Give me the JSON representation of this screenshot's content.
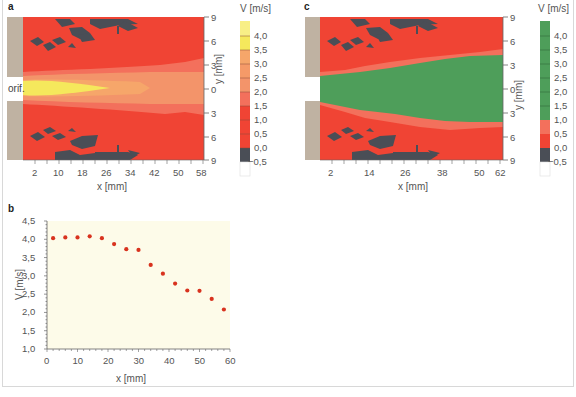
{
  "figure": {
    "panels": [
      "a",
      "b",
      "c"
    ],
    "colorbar_title": "V [m/s]",
    "orifice_label": "orif.",
    "colors": {
      "tan": "#bfb2a2",
      "red": "#f04434",
      "salmon": "#f3705c",
      "orange_light": "#f3946a",
      "orange": "#f6a66a",
      "yellow": "#f5e85c",
      "green": "#4e9e5a",
      "dark": "#4a4e56",
      "plot_bg": "#fdfbe9",
      "dot": "#d8321e"
    }
  },
  "chart_data": [
    {
      "panel": "a",
      "type": "heatmap",
      "title": "",
      "xlabel": "x [mm]",
      "ylabel": "y [mm]",
      "x_ticks": [
        "2",
        "10",
        "18",
        "26",
        "34",
        "42",
        "50",
        "58"
      ],
      "y_ticks": [
        "9",
        "6",
        "3",
        "0",
        "3",
        "6",
        "9"
      ],
      "colorbar": {
        "label": "V [m/s]",
        "levels": [
          "4,0",
          "3,5",
          "3,0",
          "2,5",
          "2,0",
          "1,5",
          "1,0",
          "0,5",
          "0,0",
          "−0,5"
        ],
        "scheme": "yellow (high) → orange → red → dark grey (≤0) → white"
      },
      "annotation": "orif."
    },
    {
      "panel": "b",
      "type": "scatter",
      "title": "",
      "xlabel": "x [mm]",
      "ylabel": "V [m/s]",
      "xlim": [
        0,
        60
      ],
      "ylim": [
        1.0,
        4.5
      ],
      "x_ticks": [
        "0",
        "10",
        "20",
        "30",
        "40",
        "50",
        "60"
      ],
      "y_ticks": [
        "4,5",
        "4,0",
        "3,5",
        "3,0",
        "2,5",
        "2,0",
        "1,5",
        "1,0"
      ],
      "x": [
        2,
        6,
        10,
        14,
        18,
        22,
        26,
        30,
        34,
        38,
        42,
        46,
        50,
        54,
        58
      ],
      "values": [
        4.03,
        4.05,
        4.05,
        4.08,
        4.03,
        3.87,
        3.73,
        3.71,
        3.3,
        3.06,
        2.79,
        2.6,
        2.59,
        2.37,
        2.08
      ],
      "grid": false
    },
    {
      "panel": "c",
      "type": "heatmap",
      "title": "",
      "xlabel": "x [mm]",
      "ylabel": "y [mm]",
      "x_ticks": [
        "2",
        "14",
        "26",
        "38",
        "50",
        "62"
      ],
      "y_ticks": [
        "9",
        "6",
        "3",
        "0",
        "3",
        "6",
        "9"
      ],
      "colorbar": {
        "label": "V [m/s]",
        "levels": [
          "4,0",
          "3,5",
          "3,0",
          "2,5",
          "2,0",
          "1,5",
          "1,0",
          "0,5",
          "0,0",
          "−0,5"
        ],
        "scheme": "green (≥1,0) → salmon → red → dark grey (≤0) → white"
      }
    }
  ]
}
